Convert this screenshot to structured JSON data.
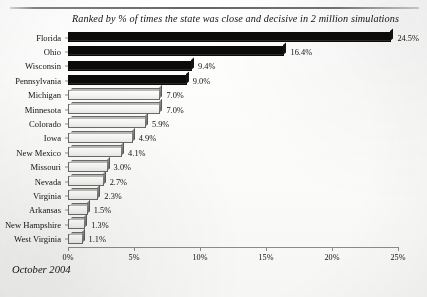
{
  "document": {
    "caption": "October 2004",
    "rule_color": "#5d5d5a"
  },
  "chart_data": {
    "type": "bar",
    "orientation": "horizontal",
    "title": "Ranked by % of times the state was close and decisive in 2 million simulations",
    "xlabel": "",
    "ylabel": "",
    "xlim": [
      0,
      25
    ],
    "grid": false,
    "legend": null,
    "xticks": [
      "0%",
      "5%",
      "10%",
      "15%",
      "20%",
      "25%"
    ],
    "xtick_values": [
      0,
      5,
      10,
      15,
      20,
      25
    ],
    "categories": [
      "Florida",
      "Ohio",
      "Wisconsin",
      "Pennsylvania",
      "Michigan",
      "Minnesota",
      "Colorado",
      "Iowa",
      "New Mexico",
      "Missouri",
      "Nevada",
      "Virginia",
      "Arkansas",
      "New Hampshire",
      "West Virginia"
    ],
    "values": [
      24.5,
      16.4,
      9.4,
      9.0,
      7.0,
      7.0,
      5.9,
      4.9,
      4.1,
      3.0,
      2.7,
      2.3,
      1.5,
      1.3,
      1.1
    ],
    "data_labels": [
      "24.5%",
      "16.4%",
      "9.4%",
      "9.0%",
      "7.0%",
      "7.0%",
      "5.9%",
      "4.9%",
      "4.1%",
      "3.0%",
      "2.7%",
      "2.3%",
      "1.5%",
      "1.3%",
      "1.1%"
    ],
    "bar_styles": [
      "dark",
      "dark",
      "dark",
      "dark",
      "light",
      "light",
      "light",
      "light",
      "light",
      "light",
      "light",
      "light",
      "light",
      "light",
      "light"
    ],
    "colors": {
      "dark_bar": "#0c0b09",
      "light_bar": "#f4f4f3",
      "bar_outline": "#6a6a67",
      "axis": "#8b8b88",
      "text": "#14120e"
    }
  }
}
